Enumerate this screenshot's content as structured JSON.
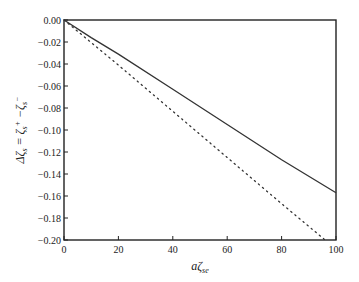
{
  "chart_data": {
    "type": "line",
    "title": "",
    "xlabel": "aζ_se",
    "ylabel": "Δζ_s = ζ_s+ − ζ_s−",
    "xlim": [
      0,
      100
    ],
    "ylim": [
      -0.2,
      0.0
    ],
    "x_ticks": [
      "0",
      "20",
      "40",
      "60",
      "80",
      "100"
    ],
    "y_ticks": [
      "0.00",
      "-0.02",
      "-0.04",
      "-0.06",
      "-0.08",
      "-0.10",
      "-0.12",
      "-0.14",
      "-0.16",
      "-0.18",
      "-0.20"
    ],
    "grid": false,
    "legend": null,
    "series": [
      {
        "name": "solid",
        "style": "solid",
        "x": [
          0,
          10,
          20,
          40,
          60,
          80,
          100
        ],
        "values": [
          0.0,
          -0.016,
          -0.031,
          -0.063,
          -0.095,
          -0.127,
          -0.157
        ]
      },
      {
        "name": "dotted",
        "style": "dotted",
        "x": [
          0,
          20,
          40,
          60,
          80,
          96
        ],
        "values": [
          0.0,
          -0.041,
          -0.083,
          -0.125,
          -0.167,
          -0.2
        ]
      }
    ]
  }
}
